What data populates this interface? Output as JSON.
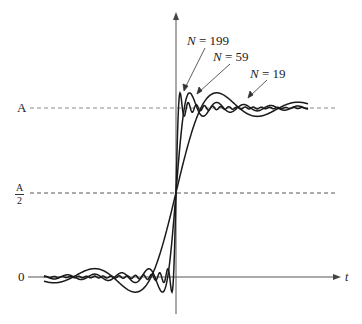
{
  "figure": {
    "y_labels": {
      "top": "A",
      "half_num": "A",
      "half_den": "2",
      "zero": "0"
    },
    "x_axis_label": "t",
    "curves": [
      {
        "name": "N = 199",
        "N": 199,
        "label_var": "N",
        "label_eq": " = 199"
      },
      {
        "name": "N = 59",
        "N": 59,
        "label_var": "N",
        "label_eq": " = 59"
      },
      {
        "name": "N = 19",
        "N": 19,
        "label_var": "N",
        "label_eq": " = 19"
      }
    ],
    "colors": {
      "curve": "#1a1a1a",
      "axis": "#555555",
      "dashed": "#777777",
      "arrow": "#555555"
    }
  }
}
